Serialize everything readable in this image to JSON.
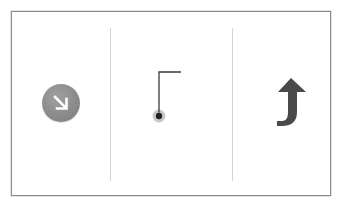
{
  "diagram": {
    "panels": [
      {
        "id": "panel-1",
        "icon": "arrow-down-right-circle-icon",
        "description": "White diagonal down-right arrow in grey circle"
      },
      {
        "id": "panel-2",
        "icon": "connector-pin-icon",
        "description": "Dark dot with grey halo connected to an L-shaped line going up then right"
      },
      {
        "id": "panel-3",
        "icon": "curved-arrow-up-icon",
        "description": "Dark grey arrow curving from left then pointing upward"
      }
    ],
    "colors": {
      "frame_border": "#8c8c8c",
      "divider": "#d4d4d4",
      "circle_fill": "#8a8a8a",
      "arrow_white": "#ffffff",
      "line": "#3a3a3a",
      "dot": "#222222",
      "dot_halo": "#c4c4c4",
      "curved_arrow": "#4a4a4a"
    }
  }
}
